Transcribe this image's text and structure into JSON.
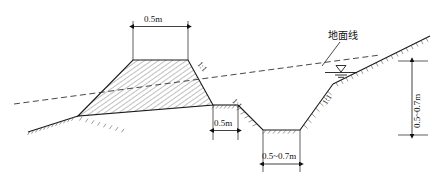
{
  "diagram": {
    "title_label": "地面线",
    "title_label_meaning": "ground line",
    "dimensions": {
      "crest_width": "0.5m",
      "berm_width": "0.5m",
      "ditch_bottom_width": "0.5~0.7m",
      "ditch_depth": "0.5~0.7m"
    },
    "slopes": {
      "embankment_right": "1:1",
      "ditch_left": "1:1",
      "ditch_right": "1:1"
    },
    "symbols": {
      "water_table": "water-table-triangle",
      "ground_hatch": "earth-hatch-ticks",
      "fill_hatch": "diagonal-hatch"
    },
    "colors": {
      "line": "#1a1a1a",
      "hatch": "#555555",
      "dashed": "#333333",
      "background": "#ffffff"
    }
  }
}
